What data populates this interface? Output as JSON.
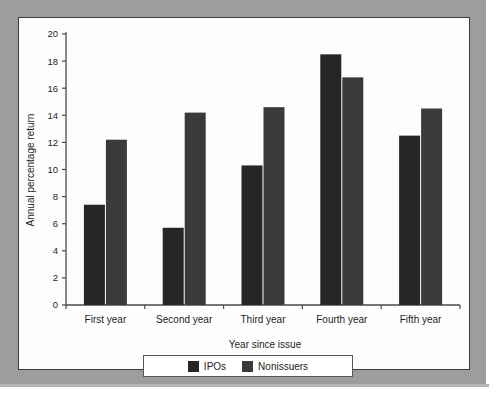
{
  "chart_data": {
    "type": "bar",
    "title": "",
    "xlabel": "Year since issue",
    "ylabel": "Annual percentage return",
    "categories": [
      "First year",
      "Second year",
      "Third year",
      "Fourth year",
      "Fifth year"
    ],
    "series": [
      {
        "name": "IPOs",
        "color": "#262626",
        "values": [
          7.4,
          5.7,
          10.3,
          18.5,
          12.5
        ]
      },
      {
        "name": "Nonissuers",
        "color": "#3a3a3a",
        "values": [
          12.2,
          14.2,
          14.6,
          16.8,
          14.5
        ]
      }
    ],
    "ylim": [
      0,
      20
    ],
    "yticks": [
      0,
      2,
      4,
      6,
      8,
      10,
      12,
      14,
      16,
      18,
      20
    ],
    "ytick_labels": [
      "0",
      "2",
      "4",
      "6",
      "8",
      "10",
      "12",
      "14",
      "16",
      "18",
      "20"
    ],
    "grid": false,
    "legend_position": "bottom"
  },
  "legend": {
    "items": [
      {
        "label": "IPOs",
        "color": "#262626"
      },
      {
        "label": "Nonissuers",
        "color": "#3a3a3a"
      }
    ]
  },
  "colors": {
    "mat": "#9d9d9d",
    "panel": "#fdfdfd",
    "frame": "#3b3b3b",
    "axis": "#4a4a4a",
    "ipo": "#262626",
    "nonissuer": "#3a3a3a"
  }
}
